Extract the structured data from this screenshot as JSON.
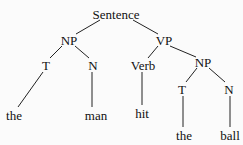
{
  "diagram": {
    "type": "syntax-tree",
    "nodes": [
      {
        "id": "s",
        "label": "Sentence",
        "x": 116,
        "y": 14
      },
      {
        "id": "np1",
        "label": "NP",
        "x": 69,
        "y": 40
      },
      {
        "id": "vp",
        "label": "VP",
        "x": 164,
        "y": 40
      },
      {
        "id": "t1",
        "label": "T",
        "x": 46,
        "y": 65
      },
      {
        "id": "n1",
        "label": "N",
        "x": 93,
        "y": 65
      },
      {
        "id": "verb",
        "label": "Verb",
        "x": 143,
        "y": 65
      },
      {
        "id": "np2",
        "label": "NP",
        "x": 203,
        "y": 62
      },
      {
        "id": "t2",
        "label": "T",
        "x": 182,
        "y": 89
      },
      {
        "id": "n2",
        "label": "N",
        "x": 229,
        "y": 89
      },
      {
        "id": "w1",
        "label": "the",
        "x": 14,
        "y": 115
      },
      {
        "id": "w2",
        "label": "man",
        "x": 96,
        "y": 115
      },
      {
        "id": "w3",
        "label": "hit",
        "x": 142,
        "y": 113
      },
      {
        "id": "w4",
        "label": "the",
        "x": 184,
        "y": 135
      },
      {
        "id": "w5",
        "label": "ball",
        "x": 230,
        "y": 135
      }
    ],
    "edges": [
      {
        "x1": 100,
        "y1": 20,
        "x2": 76,
        "y2": 34
      },
      {
        "x1": 133,
        "y1": 20,
        "x2": 158,
        "y2": 34
      },
      {
        "x1": 62,
        "y1": 46,
        "x2": 50,
        "y2": 58
      },
      {
        "x1": 75,
        "y1": 46,
        "x2": 89,
        "y2": 58
      },
      {
        "x1": 158,
        "y1": 46,
        "x2": 148,
        "y2": 58
      },
      {
        "x1": 170,
        "y1": 46,
        "x2": 196,
        "y2": 57
      },
      {
        "x1": 197,
        "y1": 68,
        "x2": 186,
        "y2": 82
      },
      {
        "x1": 209,
        "y1": 68,
        "x2": 225,
        "y2": 82
      },
      {
        "x1": 43,
        "y1": 72,
        "x2": 18,
        "y2": 107
      },
      {
        "x1": 92,
        "y1": 72,
        "x2": 92,
        "y2": 107
      },
      {
        "x1": 142,
        "y1": 72,
        "x2": 142,
        "y2": 105
      },
      {
        "x1": 183,
        "y1": 96,
        "x2": 183,
        "y2": 127
      },
      {
        "x1": 230,
        "y1": 96,
        "x2": 230,
        "y2": 127
      }
    ]
  }
}
